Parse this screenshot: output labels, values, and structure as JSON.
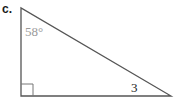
{
  "problem": {
    "label": "c.",
    "angle_label": "58°",
    "side_label": "3",
    "colors": {
      "stroke": "#555555",
      "angle_text": "#9a9a9a",
      "side_text": "#222222"
    }
  }
}
